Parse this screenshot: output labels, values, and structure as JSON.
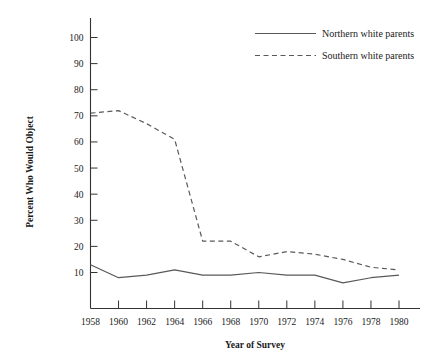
{
  "chart_data": {
    "type": "line",
    "title": "",
    "xlabel": "Year of Survey",
    "ylabel": "Percent Who Would Object",
    "x": [
      1958,
      1960,
      1962,
      1964,
      1966,
      1968,
      1970,
      1972,
      1974,
      1976,
      1978,
      1980
    ],
    "categories": [
      "1958",
      "1960",
      "1962",
      "1964",
      "1966",
      "1968",
      "1970",
      "1972",
      "1974",
      "1976",
      "1978",
      "1980"
    ],
    "xlim": [
      1957,
      1981
    ],
    "ylim": [
      0,
      105
    ],
    "yticks": [
      10,
      20,
      30,
      40,
      50,
      60,
      70,
      80,
      90,
      100
    ],
    "ytick_labels": [
      "10",
      "20",
      "30",
      "40",
      "50",
      "60",
      "70",
      "80",
      "90",
      "100"
    ],
    "grid": false,
    "legend_position": "top-right",
    "series": [
      {
        "name": "Northern white parents",
        "style": "solid",
        "color": "#595959",
        "values": [
          13,
          8,
          9,
          11,
          9,
          9,
          10,
          9,
          9,
          6,
          8,
          9
        ]
      },
      {
        "name": "Southern white parents",
        "style": "dashed",
        "color": "#595959",
        "values": [
          71,
          72,
          67,
          61,
          22,
          22,
          16,
          18,
          17,
          15,
          12,
          11
        ]
      }
    ]
  },
  "legend": {
    "items": [
      {
        "label": "Northern white parents",
        "style": "solid"
      },
      {
        "label": "Southern white parents",
        "style": "dashed"
      }
    ]
  }
}
